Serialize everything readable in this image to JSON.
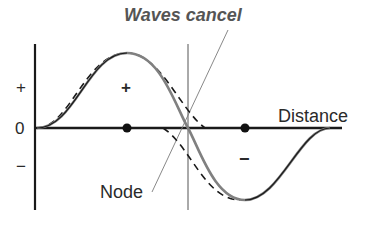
{
  "title": "Waves cancel",
  "axis": {
    "y_labels": {
      "positive": "+",
      "zero": "0",
      "negative": "−"
    },
    "x_label": "Distance"
  },
  "regions": {
    "positive": "+",
    "negative": "−"
  },
  "annotations": {
    "node": "Node"
  },
  "colors": {
    "axis": "#1a1a1a",
    "solid_wave": "#808080",
    "dashed_wave": "#1a1a1a",
    "pointer": "#7a7a7a",
    "title": "#555555"
  }
}
